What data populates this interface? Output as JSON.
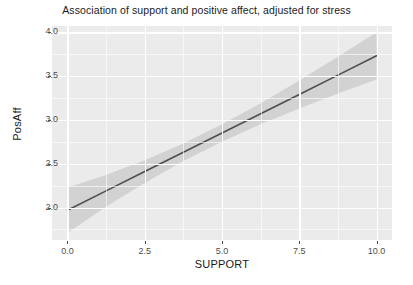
{
  "chart_data": {
    "type": "line",
    "title": "Association of support and positive affect, adjusted for stress",
    "xlabel": "SUPPORT",
    "ylabel": "PosAff",
    "xlim": [
      -0.5,
      10.5
    ],
    "ylim": [
      1.63,
      4.07
    ],
    "grid": true,
    "legend": "none",
    "panel_background": "#EBEBEB",
    "grid_color": "#FFFFFF",
    "line_color": "#4D4D4D",
    "ribbon_color": "#BEBEBE",
    "xticks": [
      "0.0",
      "2.5",
      "5.0",
      "7.5",
      "10.0"
    ],
    "xtick_values": [
      0.0,
      2.5,
      5.0,
      7.5,
      10.0
    ],
    "yticks": [
      "2.0",
      "2.5",
      "3.0",
      "3.5",
      "4.0"
    ],
    "ytick_values": [
      2.0,
      2.5,
      3.0,
      3.5,
      4.0
    ],
    "x_minor_values": [
      1.25,
      3.75,
      6.25,
      8.75
    ],
    "y_minor_values": [
      1.75,
      2.25,
      2.75,
      3.25,
      3.75
    ],
    "series": [
      {
        "name": "fitted regression line",
        "x": [
          0.0,
          1.25,
          2.5,
          3.75,
          5.0,
          6.25,
          7.5,
          8.75,
          10.0
        ],
        "values": [
          1.97,
          2.19,
          2.41,
          2.63,
          2.85,
          3.07,
          3.29,
          3.51,
          3.73
        ],
        "ci_lower": [
          1.71,
          2.01,
          2.28,
          2.53,
          2.75,
          2.95,
          3.13,
          3.3,
          3.46
        ],
        "ci_upper": [
          2.23,
          2.37,
          2.54,
          2.73,
          2.95,
          3.19,
          3.45,
          3.72,
          4.0
        ]
      }
    ]
  },
  "footer": {
    "cropped_caption": ""
  }
}
